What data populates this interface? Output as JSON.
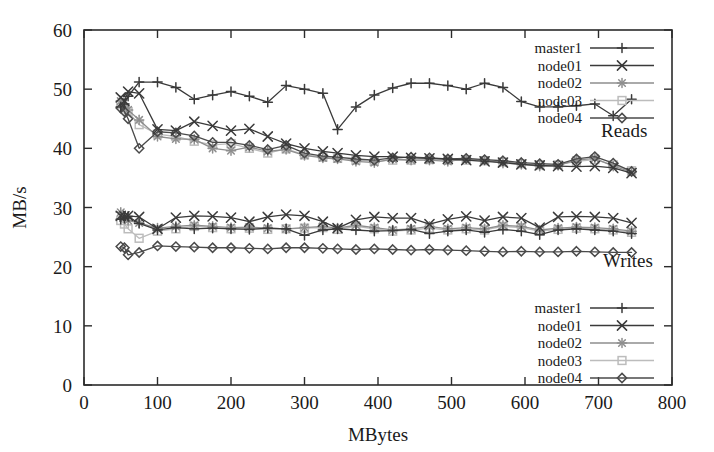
{
  "chart_data": {
    "type": "line",
    "title": "",
    "xlabel": "MBytes",
    "ylabel": "MB/s",
    "xlim": [
      0,
      800
    ],
    "ylim": [
      0,
      60
    ],
    "xticks": [
      0,
      100,
      200,
      300,
      400,
      500,
      600,
      700,
      800
    ],
    "yticks": [
      0,
      10,
      20,
      30,
      40,
      50,
      60
    ],
    "grid": false,
    "annotations": [
      {
        "text": "Reads",
        "x": 735,
        "y": 42
      },
      {
        "text": "Writes",
        "x": 740,
        "y": 20
      }
    ],
    "legends": [
      {
        "name": "reads-legend",
        "position": "top-right",
        "entries": [
          "master1",
          "node01",
          "node02",
          "node03",
          "node04"
        ]
      },
      {
        "name": "writes-legend",
        "position": "bottom-right",
        "entries": [
          "master1",
          "node01",
          "node02",
          "node03",
          "node04"
        ]
      }
    ],
    "markers": {
      "master1": "plus",
      "node01": "cross",
      "node02": "asterisk",
      "node03": "square",
      "node04": "diamond"
    },
    "colors": {
      "master1": "#3a3a3a",
      "node01": "#3a3a3a",
      "node02": "#8e8e8e",
      "node03": "#bcbcbc",
      "node04": "#4a4a4a",
      "axis": "#2b2b2b",
      "background": "#ffffff"
    },
    "groups": [
      {
        "name": "Reads",
        "x": [
          50,
          55,
          60,
          75,
          100,
          125,
          150,
          175,
          200,
          225,
          250,
          275,
          300,
          325,
          345,
          370,
          395,
          420,
          445,
          470,
          495,
          520,
          545,
          570,
          595,
          620,
          645,
          670,
          695,
          720,
          745
        ],
        "series": [
          {
            "name": "master1",
            "values": [
              47.0,
              47.5,
              48.8,
              51.2,
              51.2,
              50.3,
              48.3,
              49.0,
              49.6,
              48.8,
              47.8,
              50.6,
              50.0,
              49.3,
              43.2,
              47.0,
              49.0,
              50.2,
              51.0,
              51.0,
              50.6,
              50.0,
              51.0,
              50.3,
              47.9,
              47.0,
              47.0,
              47.2,
              47.5,
              45.5,
              48.3
            ]
          },
          {
            "name": "node01",
            "values": [
              48.6,
              48.0,
              49.6,
              49.3,
              43.2,
              43.0,
              44.5,
              43.8,
              43.0,
              43.3,
              42.0,
              40.8,
              40.0,
              39.5,
              39.2,
              38.8,
              38.6,
              38.6,
              38.4,
              38.3,
              38.2,
              38.0,
              37.8,
              37.6,
              37.3,
              37.1,
              37.0,
              36.9,
              37.0,
              36.7,
              35.8
            ]
          },
          {
            "name": "node02",
            "values": [
              48.0,
              47.0,
              46.5,
              44.8,
              42.0,
              41.6,
              41.5,
              40.0,
              39.6,
              40.2,
              39.5,
              39.8,
              38.8,
              38.4,
              38.2,
              37.8,
              37.6,
              38.2,
              38.0,
              38.0,
              37.8,
              38.2,
              38.0,
              37.5,
              37.3,
              37.0,
              37.1,
              38.0,
              38.3,
              37.0,
              36.0
            ]
          },
          {
            "name": "node03",
            "values": [
              47.4,
              46.8,
              46.2,
              44.0,
              42.4,
              42.0,
              41.2,
              40.6,
              40.8,
              40.0,
              39.2,
              39.9,
              38.9,
              38.5,
              38.3,
              38.0,
              37.8,
              38.0,
              38.0,
              38.1,
              38.0,
              38.0,
              37.9,
              37.7,
              37.4,
              37.2,
              37.2,
              37.8,
              38.1,
              37.2,
              36.2
            ]
          },
          {
            "name": "node04",
            "values": [
              46.8,
              46.2,
              45.0,
              40.0,
              42.8,
              42.6,
              42.1,
              41.0,
              41.0,
              40.5,
              39.8,
              40.5,
              39.2,
              38.7,
              38.5,
              38.2,
              38.0,
              38.4,
              38.5,
              38.4,
              38.2,
              38.3,
              38.1,
              37.9,
              37.6,
              37.4,
              37.3,
              38.2,
              38.6,
              37.5,
              36.1
            ]
          }
        ]
      },
      {
        "name": "Writes",
        "x": [
          50,
          55,
          60,
          75,
          100,
          125,
          150,
          175,
          200,
          225,
          250,
          275,
          300,
          325,
          345,
          370,
          395,
          420,
          445,
          470,
          495,
          520,
          545,
          570,
          595,
          620,
          645,
          670,
          695,
          720,
          745
        ],
        "series": [
          {
            "name": "master1",
            "values": [
              28.0,
              28.2,
              28.5,
              27.3,
              26.2,
              26.6,
              26.4,
              26.5,
              26.4,
              26.3,
              26.5,
              26.4,
              25.3,
              26.2,
              26.4,
              26.2,
              26.0,
              26.1,
              26.3,
              25.6,
              26.0,
              26.2,
              25.8,
              26.3,
              26.0,
              25.4,
              26.2,
              26.4,
              26.2,
              26.0,
              25.6
            ]
          },
          {
            "name": "node01",
            "values": [
              28.6,
              28.5,
              28.6,
              28.4,
              26.4,
              28.3,
              28.6,
              28.5,
              28.3,
              27.6,
              28.4,
              28.8,
              28.6,
              27.6,
              26.5,
              27.9,
              28.4,
              28.2,
              28.2,
              27.2,
              28.0,
              28.5,
              27.8,
              28.4,
              28.2,
              26.6,
              28.4,
              28.5,
              28.4,
              28.2,
              27.4
            ]
          },
          {
            "name": "node02",
            "values": [
              29.2,
              28.2,
              27.8,
              27.4,
              26.5,
              26.8,
              27.0,
              26.8,
              26.6,
              26.7,
              26.5,
              26.4,
              26.6,
              26.8,
              26.5,
              27.0,
              26.6,
              26.2,
              26.4,
              26.8,
              26.4,
              26.6,
              26.4,
              27.0,
              26.8,
              26.2,
              26.5,
              26.7,
              26.6,
              26.4,
              26.0
            ]
          },
          {
            "name": "node03",
            "values": [
              27.8,
              27.2,
              26.4,
              24.8,
              26.0,
              26.4,
              26.8,
              26.6,
              26.4,
              26.5,
              26.3,
              26.4,
              26.5,
              26.6,
              26.3,
              26.8,
              26.4,
              26.0,
              26.2,
              26.5,
              26.2,
              26.4,
              26.2,
              26.8,
              26.6,
              26.0,
              26.3,
              26.5,
              26.4,
              26.2,
              25.8
            ]
          },
          {
            "name": "node04",
            "values": [
              23.4,
              23.2,
              22.0,
              22.4,
              23.5,
              23.4,
              23.3,
              23.2,
              23.2,
              23.1,
              23.0,
              23.2,
              23.2,
              23.1,
              23.0,
              22.9,
              23.0,
              22.9,
              22.8,
              22.9,
              22.8,
              22.7,
              22.6,
              22.5,
              22.6,
              22.5,
              22.5,
              22.6,
              22.5,
              22.4,
              22.4
            ]
          }
        ]
      }
    ]
  },
  "labels": {
    "ylabel": "MB/s",
    "xlabel": "MBytes",
    "reads": "Reads",
    "writes": "Writes"
  },
  "legend_reads": {
    "items": [
      "master1",
      "node01",
      "node02",
      "node03",
      "node04"
    ]
  },
  "legend_writes": {
    "items": [
      "master1",
      "node01",
      "node02",
      "node03",
      "node04"
    ]
  },
  "axis": {
    "xticks": [
      "0",
      "100",
      "200",
      "300",
      "400",
      "500",
      "600",
      "700",
      "800"
    ],
    "yticks": [
      "0",
      "10",
      "20",
      "30",
      "40",
      "50",
      "60"
    ]
  }
}
